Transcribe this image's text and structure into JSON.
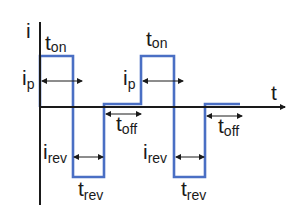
{
  "diagram": {
    "title": "",
    "type": "pulse-reverse current waveform",
    "axes": {
      "y_label": "i",
      "x_label": "t"
    },
    "labels": {
      "t_on_1": {
        "main": "t",
        "sub": "on"
      },
      "t_on_2": {
        "main": "t",
        "sub": "on"
      },
      "i_p_1": {
        "main": "i",
        "sub": "p"
      },
      "i_p_2": {
        "main": "i",
        "sub": "p"
      },
      "t_off_1": {
        "main": "t",
        "sub": "off"
      },
      "t_off_2": {
        "main": "t",
        "sub": "off"
      },
      "i_rev_1": {
        "main": "i",
        "sub": "rev"
      },
      "i_rev_2": {
        "main": "i",
        "sub": "rev"
      },
      "t_rev_1": {
        "main": "t",
        "sub": "rev"
      },
      "t_rev_2": {
        "main": "t",
        "sub": "rev"
      }
    },
    "colors": {
      "waveform": "#4a6fc4",
      "axes": "#1a1a1a",
      "arrows": "#1a1a1a",
      "background": "#ffffff"
    },
    "waveform_segments": [
      {
        "phase": "on",
        "level": "i_p",
        "cycle": 1
      },
      {
        "phase": "reverse",
        "level": "-i_rev",
        "cycle": 1
      },
      {
        "phase": "off",
        "level": "0",
        "cycle": 1
      },
      {
        "phase": "on",
        "level": "i_p",
        "cycle": 2
      },
      {
        "phase": "reverse",
        "level": "-i_rev",
        "cycle": 2
      },
      {
        "phase": "off",
        "level": "0",
        "cycle": 2
      }
    ]
  }
}
